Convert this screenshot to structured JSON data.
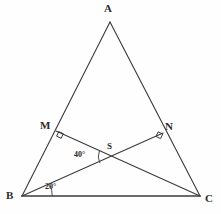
{
  "figure": {
    "background_color": "#fefefe",
    "stroke_color": "#3a3a3a",
    "base_stroke_color": "#6b6b6b",
    "label_color": "#2b2b2b"
  },
  "vertices": {
    "A": {
      "label": "A",
      "x": 110,
      "y": 22,
      "label_x": 104,
      "label_y": 5
    },
    "B": {
      "label": "B",
      "x": 22,
      "y": 196,
      "label_x": 6,
      "label_y": 192
    },
    "C": {
      "label": "C",
      "x": 200,
      "y": 196,
      "label_x": 205,
      "label_y": 193
    },
    "M": {
      "label": "M",
      "x": 56,
      "y": 131,
      "label_x": 41,
      "label_y": 120
    },
    "N": {
      "label": "N",
      "x": 163,
      "y": 133,
      "label_x": 166,
      "label_y": 121
    },
    "S": {
      "label": "S",
      "x": 113,
      "y": 157,
      "label_x": 107,
      "label_y": 142
    }
  },
  "segments": [
    {
      "name": "side-AB",
      "from": "A",
      "to": "B",
      "x1": 110,
      "y1": 22,
      "x2": 22,
      "y2": 196,
      "weight": 1
    },
    {
      "name": "side-AC",
      "from": "A",
      "to": "C",
      "x1": 110,
      "y1": 22,
      "x2": 200,
      "y2": 196,
      "weight": 1
    },
    {
      "name": "side-BC",
      "from": "B",
      "to": "C",
      "x1": 22,
      "y1": 196,
      "x2": 200,
      "y2": 196,
      "weight": 2
    },
    {
      "name": "cevian-BN",
      "from": "B",
      "to": "N",
      "x1": 22,
      "y1": 196,
      "x2": 163,
      "y2": 133,
      "weight": 1
    },
    {
      "name": "cevian-CM",
      "from": "C",
      "to": "M",
      "x1": 200,
      "y1": 196,
      "x2": 56,
      "y2": 131,
      "weight": 1
    }
  ],
  "angles": [
    {
      "name": "right-angle-at-M",
      "value": "90",
      "marker": "square",
      "at": "M"
    },
    {
      "name": "right-angle-at-N",
      "value": "90",
      "marker": "square",
      "at": "N"
    },
    {
      "name": "angle-at-S",
      "label": "40°",
      "value": 40,
      "at": "S",
      "label_x": 74,
      "label_y": 151
    },
    {
      "name": "angle-at-B",
      "label": "20°",
      "value": 20,
      "at": "B",
      "label_x": 45,
      "label_y": 183
    }
  ],
  "icons": {
    "right_angle_marker": "right-angle-square-icon",
    "angle_arc": "angle-arc-icon"
  }
}
